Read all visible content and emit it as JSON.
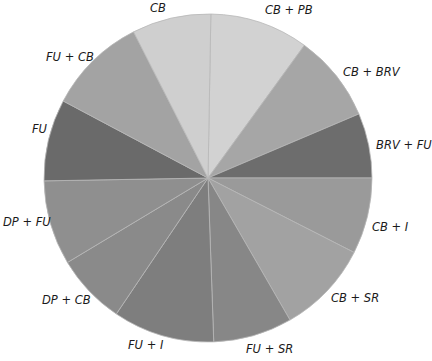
{
  "chart_data": {
    "type": "pie",
    "title": "",
    "center": [
      208,
      178
    ],
    "radius": 164,
    "start_angle_deg_clockwise_from_top": 1,
    "slices": [
      {
        "label": "CB + PB",
        "degrees": 35,
        "percent": 9.7,
        "color": "#d2d2d2"
      },
      {
        "label": "CB + BRV",
        "degrees": 31,
        "percent": 8.6,
        "color": "#a6a6a6"
      },
      {
        "label": "BRV + FU",
        "degrees": 23,
        "percent": 6.4,
        "color": "#6d6d6d"
      },
      {
        "label": "CB + I",
        "degrees": 27,
        "percent": 7.5,
        "color": "#9a9a9a"
      },
      {
        "label": "CB + SR",
        "degrees": 33,
        "percent": 9.2,
        "color": "#a2a2a2"
      },
      {
        "label": "FU + SR",
        "degrees": 28,
        "percent": 7.8,
        "color": "#878787"
      },
      {
        "label": "FU + I",
        "degrees": 36,
        "percent": 10.0,
        "color": "#7e7e7e"
      },
      {
        "label": "DP + CB",
        "degrees": 25,
        "percent": 6.9,
        "color": "#8a8a8a"
      },
      {
        "label": "DP + FU",
        "degrees": 30,
        "percent": 8.3,
        "color": "#8f8f8f"
      },
      {
        "label": "FU",
        "degrees": 29,
        "percent": 8.1,
        "color": "#6a6a6a"
      },
      {
        "label": "FU + CB",
        "degrees": 35,
        "percent": 9.7,
        "color": "#a3a3a3"
      },
      {
        "label": "CB",
        "degrees": 28,
        "percent": 7.8,
        "color": "#cfcfcf"
      }
    ],
    "labels": [
      {
        "text": "CB",
        "x": 150,
        "y": 3
      },
      {
        "text": "CB + PB",
        "x": 265,
        "y": 5
      },
      {
        "text": "CB + BRV",
        "x": 343,
        "y": 67
      },
      {
        "text": "BRV + FU",
        "x": 376,
        "y": 140
      },
      {
        "text": "CB + I",
        "x": 372,
        "y": 222
      },
      {
        "text": "CB + SR",
        "x": 331,
        "y": 293
      },
      {
        "text": "FU + SR",
        "x": 246,
        "y": 344
      },
      {
        "text": "FU + I",
        "x": 128,
        "y": 340
      },
      {
        "text": "DP + CB",
        "x": 42,
        "y": 295
      },
      {
        "text": "DP + FU",
        "x": 3,
        "y": 217
      },
      {
        "text": "FU",
        "x": 32,
        "y": 124
      },
      {
        "text": "FU + CB",
        "x": 46,
        "y": 52
      }
    ],
    "legend": "none",
    "grid": false
  }
}
